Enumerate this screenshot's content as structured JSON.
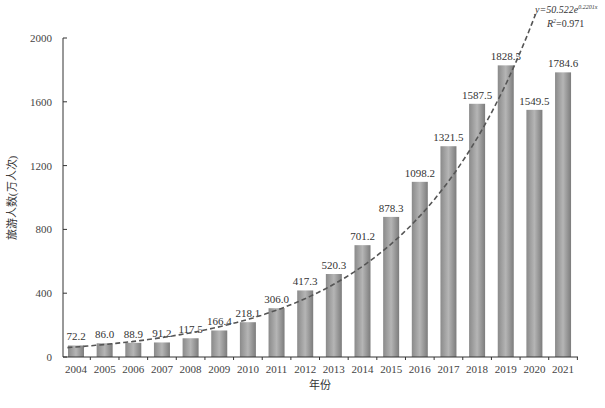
{
  "chart_data": {
    "type": "bar",
    "title": "",
    "xlabel": "年份",
    "ylabel": "旅游人数(万人次)",
    "ylim": [
      0,
      2000
    ],
    "yticks": [
      0,
      400,
      800,
      1200,
      1600,
      2000
    ],
    "grid": false,
    "legend": "none",
    "categories": [
      "2004",
      "2005",
      "2006",
      "2007",
      "2008",
      "2009",
      "2010",
      "2011",
      "2012",
      "2013",
      "2014",
      "2015",
      "2016",
      "2017",
      "2018",
      "2019",
      "2020",
      "2021"
    ],
    "values": [
      72.2,
      86.0,
      88.9,
      91.2,
      117.5,
      166.4,
      218.1,
      306.0,
      417.3,
      520.3,
      701.2,
      878.3,
      1098.2,
      1321.5,
      1587.5,
      1828.5,
      1549.5,
      1784.6
    ],
    "value_labels": [
      "72.2",
      "86.0",
      "88.9",
      "91.2",
      "117.5",
      "166.4",
      "218.1",
      "306.0",
      "417.3",
      "520.3",
      "701.2",
      "878.3",
      "1098.2",
      "1321.5",
      "1587.5",
      "1828.5",
      "1549.5",
      "1784.6"
    ],
    "trendline": {
      "type": "exponential",
      "style": "dashed",
      "a": 50.522,
      "b": 0.2201,
      "x_start_index": 1,
      "equation_text": "y=50.522e^0.2201x",
      "equation_parts": {
        "lhs": "y=50.522e",
        "exponent": "0.2201x"
      },
      "r2_text": "R²=0.971",
      "r2_parts": {
        "r": "R",
        "sup": "2",
        "rest": "=0.971"
      }
    },
    "colors": {
      "bar_dark": "#7a7a7a",
      "bar_mid": "#a8a8a8",
      "bar_light": "#c4c4c4",
      "trend": "#555555",
      "axis": "#333333"
    }
  }
}
